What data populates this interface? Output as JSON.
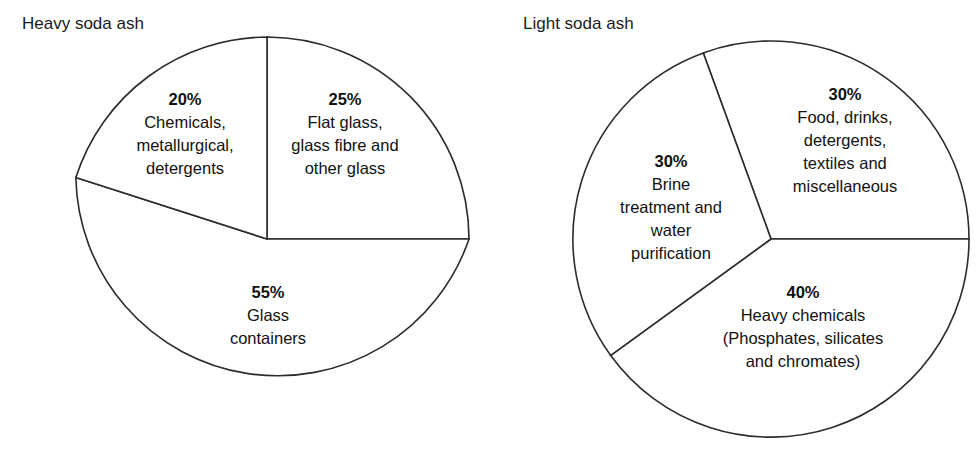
{
  "chart_data": [
    {
      "type": "pie",
      "title": "Heavy soda ash",
      "categories": [
        "Flat glass, glass fibre and other glass",
        "Glass containers",
        "Chemicals, metallurgical, detergents"
      ],
      "values": [
        25,
        55,
        20
      ],
      "unit": "%",
      "legend": "none",
      "labels_inside": true
    },
    {
      "type": "pie",
      "title": "Light soda ash",
      "categories": [
        "Food, drinks, detergents, textiles and miscellaneous",
        "Heavy chemicals (Phosphates, silicates and chromates)",
        "Brine treatment and water purification"
      ],
      "values": [
        30,
        40,
        30
      ],
      "unit": "%",
      "legend": "none",
      "labels_inside": true
    }
  ],
  "charts": {
    "heavy": {
      "title": "Heavy soda ash",
      "slices": {
        "chemicals": {
          "pct": "20%",
          "desc": "Chemicals,\nmetallurgical,\ndetergents"
        },
        "flat_glass": {
          "pct": "25%",
          "desc": "Flat glass,\nglass fibre and\nother glass"
        },
        "containers": {
          "pct": "55%",
          "desc": "Glass\ncontainers"
        }
      }
    },
    "light": {
      "title": "Light soda ash",
      "slices": {
        "food": {
          "pct": "30%",
          "desc": "Food, drinks,\ndetergents,\ntextiles and\nmiscellaneous"
        },
        "brine": {
          "pct": "30%",
          "desc": "Brine\ntreatment and\nwater\npurification"
        },
        "heavy_chemicals": {
          "pct": "40%",
          "desc": "Heavy chemicals\n(Phosphates, silicates\nand chromates)"
        }
      }
    }
  },
  "colors": {
    "stroke": "#2b2b2b",
    "fill": "#ffffff",
    "text": "#111111"
  }
}
